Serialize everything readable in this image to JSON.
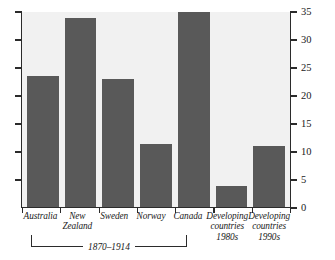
{
  "chart_data": {
    "type": "bar",
    "title": "",
    "subtitle": "",
    "xlabel": "",
    "ylabel": "",
    "ylim": [
      0,
      35
    ],
    "grid": false,
    "legend": "none",
    "y_axis_position": "right",
    "y_ticks": [
      35,
      30,
      25,
      20,
      15,
      10,
      5,
      0
    ],
    "y_tick_labels": [
      "35",
      "30",
      "25",
      "20",
      "15",
      "10",
      "5",
      "0"
    ],
    "categories": [
      "Australia",
      "New Zealand",
      "Sweden",
      "Norway",
      "Canada",
      "Developing countries 1980s",
      "Developing countries 1990s"
    ],
    "category_lines": [
      [
        "Australia"
      ],
      [
        "New",
        "Zealand"
      ],
      [
        "Sweden"
      ],
      [
        "Norway"
      ],
      [
        "Canada"
      ],
      [
        "Developing",
        "countries",
        "1980s"
      ],
      [
        "Developing",
        "countries",
        "1990s"
      ]
    ],
    "values": [
      23.5,
      34,
      23,
      11.5,
      35,
      4,
      11
    ],
    "annotations": [
      {
        "type": "group-bracket",
        "label": "1870–1914",
        "covers": [
          "Australia",
          "New Zealand",
          "Sweden",
          "Norway",
          "Canada"
        ]
      }
    ],
    "colors": {
      "bar": "#595959",
      "plot_background": "#f1f1f1",
      "page_background": "#ffffff",
      "axis": "#2b2b2b",
      "text": "#1a1a1a"
    }
  }
}
